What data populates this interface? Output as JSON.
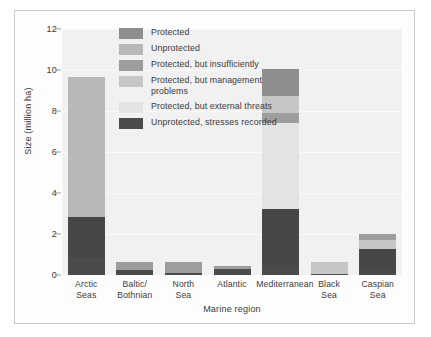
{
  "chart_data": {
    "type": "bar",
    "stacked": true,
    "title": "",
    "xlabel": "Marine region",
    "ylabel": "Size (million ha)",
    "ylim": [
      0,
      12
    ],
    "yticks": [
      0,
      2,
      4,
      6,
      8,
      10,
      12
    ],
    "grid": true,
    "legend_position": "inside-top-left",
    "categories": [
      "Arctic Seas",
      "Baltic/ Bothnian",
      "North Sea",
      "Atlantic",
      "Mediterranean",
      "Black Sea",
      "Caspian Sea"
    ],
    "category_lines": [
      [
        "Arctic",
        "Seas"
      ],
      [
        "Baltic/",
        "Bothnian"
      ],
      [
        "North",
        "Sea"
      ],
      [
        "Atlantic",
        ""
      ],
      [
        "Mediterranean",
        ""
      ],
      [
        "Black",
        "Sea"
      ],
      [
        "Caspian",
        "Sea"
      ]
    ],
    "series": [
      {
        "name": "Protected",
        "color": "#8e8e8e",
        "values": [
          0,
          0,
          0,
          0,
          0,
          0,
          0
        ]
      },
      {
        "name": "Unprotected",
        "color": "#b8b8b8",
        "values": [
          6.8,
          0,
          0,
          0,
          0,
          0,
          0
        ]
      },
      {
        "name": "Protected, but insufficiently",
        "color": "#9d9d9d",
        "values": [
          0,
          0.4,
          0.55,
          0.15,
          0.5,
          0,
          0.3
        ]
      },
      {
        "name": "Protected, but management problems",
        "color": "#c6c6c6",
        "values": [
          0,
          0,
          0,
          0,
          0.85,
          0.6,
          0.45
        ]
      },
      {
        "name": "Protected, but external threats",
        "color": "#e3e3e3",
        "values": [
          0,
          0,
          0,
          0,
          4.2,
          0,
          0
        ]
      },
      {
        "name": "Unprotected, stresses recorded",
        "color": "#4b4b4b",
        "values": [
          2.85,
          0.25,
          0.1,
          0.3,
          3.2,
          0.05,
          1.25
        ]
      }
    ],
    "bars": [
      {
        "category": "Arctic Seas",
        "total": 9.65,
        "segments": [
          {
            "series": "Unprotected, stresses recorded",
            "from": 0.0,
            "to": 0.85,
            "color": "#4b4b4b"
          },
          {
            "series": "Unprotected, stresses recorded",
            "from": 0.85,
            "to": 2.85,
            "color": "#474747"
          },
          {
            "series": "Unprotected",
            "from": 2.85,
            "to": 9.65,
            "color": "#b8b8b8"
          }
        ]
      },
      {
        "category": "Baltic/ Bothnian",
        "total": 0.65,
        "segments": [
          {
            "series": "Unprotected, stresses recorded",
            "from": 0.0,
            "to": 0.25,
            "color": "#4b4b4b"
          },
          {
            "series": "Protected, but insufficiently",
            "from": 0.25,
            "to": 0.65,
            "color": "#9d9d9d"
          }
        ]
      },
      {
        "category": "North Sea",
        "total": 0.65,
        "segments": [
          {
            "series": "Unprotected, stresses recorded",
            "from": 0.0,
            "to": 0.1,
            "color": "#4b4b4b"
          },
          {
            "series": "Protected, but insufficiently",
            "from": 0.1,
            "to": 0.65,
            "color": "#9d9d9d"
          }
        ]
      },
      {
        "category": "Atlantic",
        "total": 0.45,
        "segments": [
          {
            "series": "Unprotected, stresses recorded",
            "from": 0.0,
            "to": 0.3,
            "color": "#4b4b4b"
          },
          {
            "series": "Protected, but insufficiently",
            "from": 0.3,
            "to": 0.45,
            "color": "#9d9d9d"
          }
        ]
      },
      {
        "category": "Mediterranean",
        "total": 10.05,
        "segments": [
          {
            "series": "Unprotected, stresses recorded",
            "from": 0.0,
            "to": 0.4,
            "color": "#4b4b4b"
          },
          {
            "series": "Unprotected, stresses recorded",
            "from": 0.4,
            "to": 3.2,
            "color": "#474747"
          },
          {
            "series": "Protected, but external threats",
            "from": 3.2,
            "to": 7.4,
            "color": "#e3e3e3"
          },
          {
            "series": "Protected, but insufficiently",
            "from": 7.4,
            "to": 7.9,
            "color": "#9d9d9d"
          },
          {
            "series": "Protected, but management problems",
            "from": 7.9,
            "to": 8.75,
            "color": "#c6c6c6"
          },
          {
            "series": "Protected",
            "from": 8.75,
            "to": 10.05,
            "color": "#8e8e8e"
          }
        ]
      },
      {
        "category": "Black Sea",
        "total": 0.65,
        "segments": [
          {
            "series": "Unprotected, stresses recorded",
            "from": 0.0,
            "to": 0.05,
            "color": "#4b4b4b"
          },
          {
            "series": "Protected, but management problems",
            "from": 0.05,
            "to": 0.65,
            "color": "#c6c6c6"
          }
        ]
      },
      {
        "category": "Caspian Sea",
        "total": 2.0,
        "segments": [
          {
            "series": "Unprotected, stresses recorded",
            "from": 0.0,
            "to": 0.2,
            "color": "#4b4b4b"
          },
          {
            "series": "Unprotected, stresses recorded",
            "from": 0.2,
            "to": 1.25,
            "color": "#474747"
          },
          {
            "series": "Protected, but management problems",
            "from": 1.25,
            "to": 1.7,
            "color": "#c6c6c6"
          },
          {
            "series": "Protected, but insufficiently",
            "from": 1.7,
            "to": 2.0,
            "color": "#9d9d9d"
          }
        ]
      }
    ],
    "legend": [
      {
        "label": "Protected",
        "color": "#8e8e8e"
      },
      {
        "label": "Unprotected",
        "color": "#b8b8b8"
      },
      {
        "label": "Protected, but insufficiently",
        "color": "#9d9d9d"
      },
      {
        "label": "Protected, but management\nproblems",
        "color": "#c6c6c6"
      },
      {
        "label": "Protected, but external threats",
        "color": "#e3e3e3"
      },
      {
        "label": "Unprotected, stresses recorded",
        "color": "#4b4b4b"
      }
    ],
    "plot_background": "#f1f1f1",
    "gridline_color": "#fafafa"
  }
}
